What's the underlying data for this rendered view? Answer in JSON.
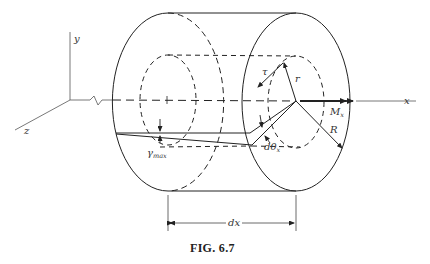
{
  "figure": {
    "caption": "FIG. 6.7"
  },
  "axes": {
    "x_label": "x",
    "y_label": "y",
    "z_label": "z"
  },
  "labels": {
    "tau": "τ",
    "r": "r",
    "moment": "M",
    "moment_sub": "x",
    "radius": "R",
    "twist": "dθ",
    "twist_sub": "x",
    "shear_strain": "γ",
    "shear_strain_sub": "max",
    "length": "dx"
  },
  "colors": {
    "stroke": "#222222",
    "axis": "#555555",
    "background": "#ffffff"
  }
}
